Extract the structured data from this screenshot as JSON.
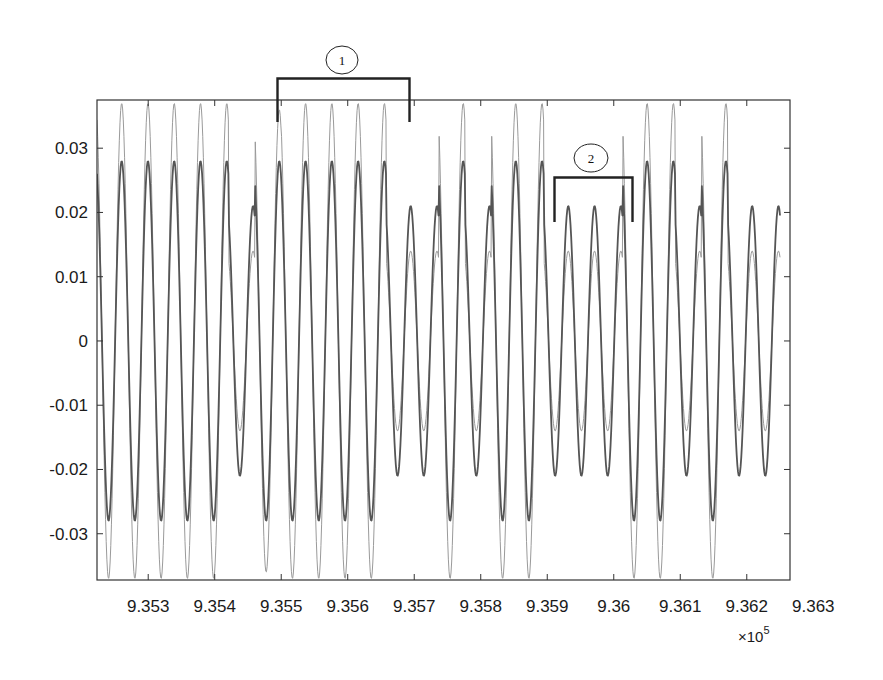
{
  "chart_data": {
    "type": "line",
    "title": "",
    "xlabel": "",
    "ylabel": "",
    "x_multiplier_label": "×10",
    "x_multiplier_exponent": "5",
    "xlim": [
      9.35223,
      9.36265
    ],
    "ylim": [
      -0.0372,
      0.0375
    ],
    "grid": false,
    "legend": null,
    "x_ticks": [
      9.353,
      9.354,
      9.355,
      9.356,
      9.357,
      9.358,
      9.359,
      9.36,
      9.361,
      9.362,
      9.363
    ],
    "x_tick_labels": [
      "9.353",
      "9.354",
      "9.355",
      "9.356",
      "9.357",
      "9.358",
      "9.359",
      "9.36",
      "9.361",
      "9.362",
      "9.363"
    ],
    "y_ticks": [
      0.03,
      0.02,
      0.01,
      0,
      -0.01,
      -0.02,
      -0.03
    ],
    "y_tick_labels": [
      "0.03",
      "0.02",
      "0.01",
      "0",
      "-0.01",
      "-0.02",
      "-0.03"
    ],
    "period_x": 0.000395,
    "x_start": 9.35223,
    "series": [
      {
        "name": "signal-outer",
        "color": "#9a9a9a",
        "width": 1.0,
        "cycle_amplitudes": [
          0.037,
          0.037,
          0.037,
          0.037,
          0.037,
          0.014,
          0.036,
          0.037,
          0.037,
          0.037,
          0.037,
          0.014,
          0.014,
          0.037,
          0.014,
          0.037,
          0.037,
          0.014,
          0.014,
          0.014,
          0.037,
          0.037,
          0.014,
          0.037,
          0.014,
          0.014
        ]
      },
      {
        "name": "signal-inner",
        "color": "#555555",
        "width": 1.8,
        "cycle_amplitudes": [
          0.028,
          0.028,
          0.028,
          0.028,
          0.028,
          0.021,
          0.028,
          0.028,
          0.028,
          0.028,
          0.028,
          0.021,
          0.021,
          0.028,
          0.021,
          0.028,
          0.028,
          0.021,
          0.021,
          0.021,
          0.028,
          0.028,
          0.021,
          0.028,
          0.021,
          0.021
        ]
      }
    ],
    "annotations": [
      {
        "id": "1",
        "label": "1",
        "x_from": 9.35507,
        "x_to": 9.35698,
        "description": "bracketed region of full-amplitude cycles"
      },
      {
        "id": "2",
        "label": "2",
        "x_from": 9.35907,
        "x_to": 9.36019,
        "description": "bracketed region of reduced-amplitude cycles"
      }
    ]
  },
  "annotations": {
    "one": "1",
    "two": "2"
  },
  "axis": {
    "multiplier": "×10",
    "exponent": "5"
  }
}
